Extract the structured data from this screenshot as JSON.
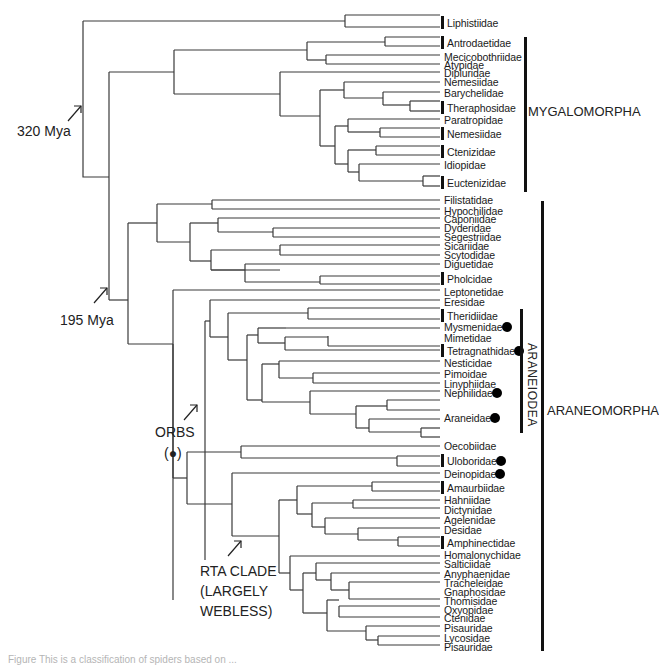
{
  "diagram": {
    "type": "phylogenetic-tree",
    "leaves": [
      {
        "name": "Liphistiidae",
        "y": 23,
        "bar": true
      },
      {
        "name": "Antrodaetidae",
        "y": 43,
        "bar": true
      },
      {
        "name": "Mecicobothriidae",
        "y": 57
      },
      {
        "name": "Atypidae",
        "y": 65
      },
      {
        "name": "Dipluridae",
        "y": 73
      },
      {
        "name": "Nemesiidae",
        "y": 82
      },
      {
        "name": "Barychelidae",
        "y": 93
      },
      {
        "name": "Theraphosidae",
        "y": 108,
        "bar": true
      },
      {
        "name": "Paratropidae",
        "y": 120
      },
      {
        "name": "Nemesiidae",
        "y": 134,
        "bar": true
      },
      {
        "name": "Ctenizidae",
        "y": 152,
        "bar": true
      },
      {
        "name": "Idiopidae",
        "y": 165
      },
      {
        "name": "Euctenizidae",
        "y": 183,
        "bar": true
      },
      {
        "name": "Filistatidae",
        "y": 200
      },
      {
        "name": "Hypochilidae",
        "y": 211
      },
      {
        "name": "Caponiidae",
        "y": 219
      },
      {
        "name": "Dyderidae",
        "y": 228
      },
      {
        "name": "Segestriidae",
        "y": 237
      },
      {
        "name": "Sicariidae",
        "y": 246
      },
      {
        "name": "Scytodidae",
        "y": 255
      },
      {
        "name": "Diguetidae",
        "y": 264
      },
      {
        "name": "Pholcidae",
        "y": 279,
        "bar": true
      },
      {
        "name": "Leptonetidae",
        "y": 292
      },
      {
        "name": "Eresidae",
        "y": 302
      },
      {
        "name": "Theridiidae",
        "y": 316,
        "bar": true
      },
      {
        "name": "Mysmenidae",
        "y": 327,
        "orb": true
      },
      {
        "name": "Mimetidae",
        "y": 338
      },
      {
        "name": "Tetragnathidae",
        "y": 351,
        "bar": true,
        "orb": true
      },
      {
        "name": "Nesticidae",
        "y": 363
      },
      {
        "name": "Pimoidae",
        "y": 374
      },
      {
        "name": "Linyphiidae",
        "y": 384
      },
      {
        "name": "Nephilidae",
        "y": 393,
        "orb": true
      },
      {
        "name": "Araneidae",
        "y": 418,
        "orb": true
      },
      {
        "name": "Oecobiidae",
        "y": 446
      },
      {
        "name": "Uloboridae",
        "y": 461,
        "bar": true,
        "orb": true
      },
      {
        "name": "Deinopidae",
        "y": 474,
        "orb": true
      },
      {
        "name": "Amaurbiidae",
        "y": 488,
        "bar": true
      },
      {
        "name": "Hahniidae",
        "y": 500
      },
      {
        "name": "Dictynidae",
        "y": 510
      },
      {
        "name": "Agelenidae",
        "y": 520
      },
      {
        "name": "Desidae",
        "y": 530
      },
      {
        "name": "Amphinectidae",
        "y": 543,
        "bar": true
      },
      {
        "name": "Homalonychidae",
        "y": 555
      },
      {
        "name": "Salticiidae",
        "y": 564
      },
      {
        "name": "Anyphaenidae",
        "y": 574
      },
      {
        "name": "Tracheleidae",
        "y": 583
      },
      {
        "name": "Gnaphosidae",
        "y": 592
      },
      {
        "name": "Thomisidae",
        "y": 601
      },
      {
        "name": "Oxyopidae",
        "y": 610
      },
      {
        "name": "Ctenidae",
        "y": 618
      },
      {
        "name": "Pisauridae",
        "y": 628
      },
      {
        "name": "Lycosidae",
        "y": 638
      },
      {
        "name": "Pisauridae",
        "y": 647
      }
    ],
    "node_labels": {
      "mya320": "320 Mya",
      "mya195": "195 Mya",
      "orbs": "ORBS",
      "orbs_symbol": "(●)",
      "rta_line1": "RTA CLADE",
      "rta_line2": "(LARGELY",
      "rta_line3": "WEBLESS)"
    },
    "clades": {
      "mygalomorpha": "MYGALOMORPHA",
      "araneomorpha": "ARANEOMORPHA",
      "araneiodea": "ARANEIODEA"
    },
    "caption": "Figure  This is a classification of spiders based on ..."
  }
}
